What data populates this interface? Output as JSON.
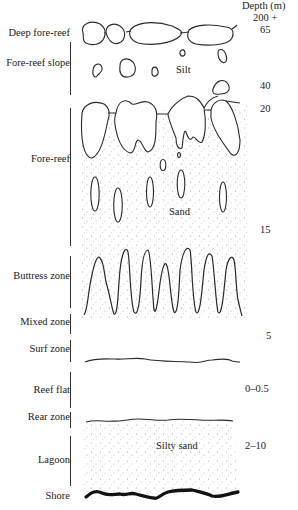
{
  "diagram": {
    "header": {
      "depth_title": "Depth (m)"
    },
    "zones": [
      {
        "id": "deep-fore-reef",
        "label": "Deep fore-reef",
        "y": 33,
        "bar": null
      },
      {
        "id": "fore-reef-slope",
        "label": "Fore-reef slope",
        "y": 63,
        "bar": [
          42,
          95
        ]
      },
      {
        "id": "fore-reef",
        "label": "Fore-reef",
        "y": 159,
        "bar": [
          108,
          246
        ]
      },
      {
        "id": "buttress-zone",
        "label": "Buttress zone",
        "y": 276,
        "bar": [
          256,
          308
        ]
      },
      {
        "id": "mixed-zone",
        "label": "Mixed zone",
        "y": 322,
        "bar": [
          314,
          334
        ]
      },
      {
        "id": "surf-zone",
        "label": "Surf zone",
        "y": 349,
        "bar": [
          340,
          362
        ]
      },
      {
        "id": "reef-flat",
        "label": "Reef flat",
        "y": 390,
        "bar": [
          372,
          408
        ]
      },
      {
        "id": "rear-zone",
        "label": "Rear zone",
        "y": 417,
        "bar": [
          412,
          428
        ]
      },
      {
        "id": "lagoon",
        "label": "Lagoon",
        "y": 460,
        "bar": [
          436,
          486
        ]
      },
      {
        "id": "shore",
        "label": "Shore",
        "y": 496,
        "bar": null
      }
    ],
    "depths": [
      {
        "label": "200 +",
        "x": 253,
        "y": 12
      },
      {
        "label": "65",
        "x": 260,
        "y": 24
      },
      {
        "label": "40",
        "x": 260,
        "y": 80
      },
      {
        "label": "20",
        "x": 260,
        "y": 103
      },
      {
        "label": "15",
        "x": 260,
        "y": 224
      },
      {
        "label": "5",
        "x": 266,
        "y": 330
      },
      {
        "label": "0–0.5",
        "x": 245,
        "y": 383
      },
      {
        "label": "2–10",
        "x": 245,
        "y": 440
      }
    ],
    "sediments": [
      {
        "label": "Silt",
        "x": 176,
        "y": 70
      },
      {
        "label": "Sand",
        "x": 169,
        "y": 212
      },
      {
        "label": "Silty sand",
        "x": 156,
        "y": 446
      }
    ],
    "colors": {
      "line": "#2a2a2a",
      "stipple": "#9a9a9a",
      "shore": "#111111"
    }
  }
}
